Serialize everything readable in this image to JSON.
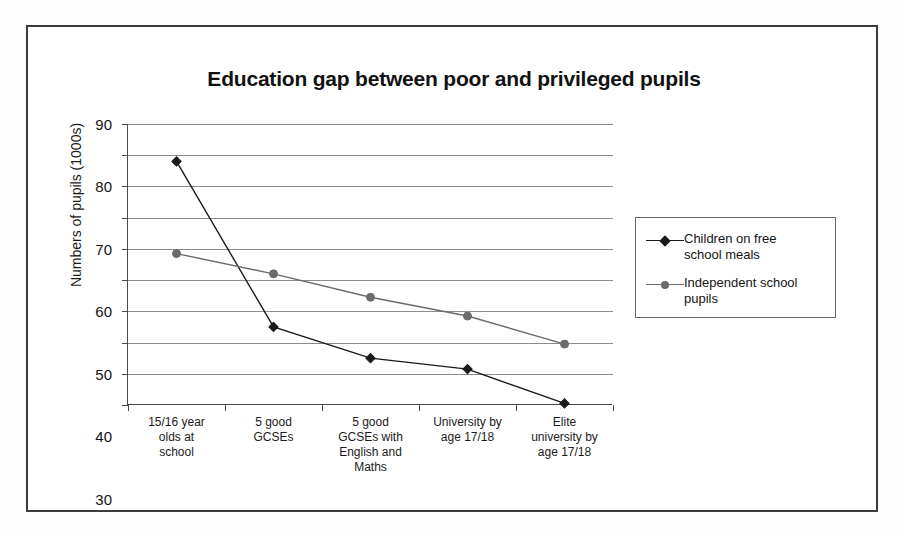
{
  "chart_data": {
    "type": "line",
    "title": "Education gap between poor and privileged pupils",
    "xlabel": "",
    "ylabel": "Numbers of pupils (1000s)",
    "ylim": [
      0,
      90
    ],
    "ytick_step": 10,
    "yticks": [
      "90",
      "80",
      "70",
      "60",
      "50",
      "40",
      "30",
      "20",
      "10",
      "0"
    ],
    "grid": true,
    "legend_position": "right",
    "categories": [
      "15/16 year olds at school",
      "5 good GCSEs",
      "5 good GCSEs with English and Maths",
      "University by age 17/18",
      "Elite university by age 17/18"
    ],
    "category_lines": [
      [
        "15/16 year",
        "olds at",
        "school"
      ],
      [
        "5 good",
        "GCSEs"
      ],
      [
        "5 good",
        "GCSEs with",
        "English and",
        "Maths"
      ],
      [
        "University by",
        "age 17/18"
      ],
      [
        "Elite",
        "university by",
        "age 17/18"
      ]
    ],
    "series": [
      {
        "name": "Children on free school meals",
        "name_lines": [
          "Children on  free",
          "school meals"
        ],
        "marker": "diamond",
        "color": "#1a1a1a",
        "values": [
          78,
          25,
          15,
          11.5,
          0.5
        ]
      },
      {
        "name": "Independent school pupils",
        "name_lines": [
          "Independent school",
          "pupils"
        ],
        "marker": "circle",
        "color": "#6b6b6b",
        "values": [
          48.5,
          42,
          34.5,
          28.5,
          19.5
        ]
      }
    ]
  },
  "colors": {
    "frame": "#3c3c3c",
    "axis": "#4a4a4a",
    "gridline": "#8c8c8c",
    "series_poor": "#1a1a1a",
    "series_privileged": "#6b6b6b",
    "background": "#ffffff"
  }
}
